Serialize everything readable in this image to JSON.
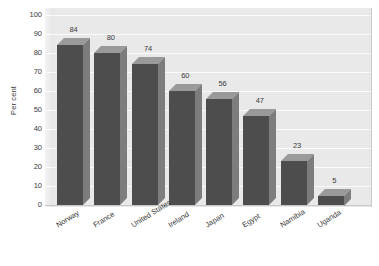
{
  "chart_data": {
    "type": "bar",
    "title": "",
    "subtitle": "",
    "xlabel": "",
    "ylabel": "Per cent",
    "ylim": [
      0,
      100
    ],
    "ytick_step": 10,
    "yticks": [
      100,
      90,
      80,
      70,
      60,
      50,
      40,
      30,
      20,
      10,
      0
    ],
    "grid": true,
    "legend": false,
    "legend_position": "none",
    "style": "3d-column",
    "value_labels_shown": true,
    "categories": [
      "Norway",
      "France",
      "United States",
      "Ireland",
      "Japan",
      "Egypt",
      "Namibia",
      "Uganda"
    ],
    "values": [
      84,
      80,
      74,
      60,
      56,
      47,
      23,
      5
    ],
    "series": [
      {
        "name": "Per cent",
        "values": [
          84,
          80,
          74,
          60,
          56,
          47,
          23,
          5
        ]
      }
    ],
    "annotations": []
  },
  "colors": {
    "plot_background": "#e9e9e9",
    "gridline": "#fafafa",
    "bar_front": "#4d4d4d",
    "bar_top": "#9a9a9a",
    "bar_side": "#7d7d7d",
    "text": "#3b3b3b",
    "page_background": "#ffffff",
    "axis_line": "#c6c6c6"
  },
  "axis": {
    "y_title": "Per cent"
  }
}
